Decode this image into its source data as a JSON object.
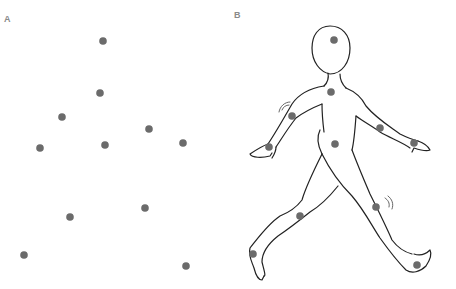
{
  "panels": [
    {
      "label": "A",
      "description": "point-light display (dots only)"
    },
    {
      "label": "B",
      "description": "walking human figure with joint markers"
    }
  ],
  "colors": {
    "dot": "#6b6b6b",
    "outline": "#222222",
    "label": "#8a8a8a"
  },
  "panel_a_points": [
    [
      103,
      41
    ],
    [
      100,
      93
    ],
    [
      62,
      117
    ],
    [
      149,
      129
    ],
    [
      40,
      148
    ],
    [
      105,
      145
    ],
    [
      183,
      143
    ],
    [
      70,
      217
    ],
    [
      145,
      208
    ],
    [
      24,
      255
    ],
    [
      186,
      266
    ]
  ],
  "panel_b_points": [
    [
      334,
      40
    ],
    [
      331,
      92
    ],
    [
      292,
      116
    ],
    [
      380,
      128
    ],
    [
      335,
      144
    ],
    [
      269,
      147
    ],
    [
      414,
      143
    ],
    [
      300,
      216
    ],
    [
      376,
      207
    ],
    [
      253,
      254
    ],
    [
      417,
      265
    ]
  ]
}
